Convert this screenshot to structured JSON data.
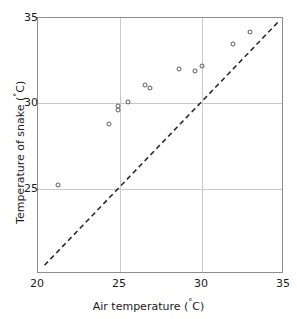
{
  "chart_data": {
    "type": "scatter",
    "title": "",
    "xlabel": "Air temperature (°C)",
    "ylabel": "Temperature of snake (°C)",
    "xlim": [
      20,
      35
    ],
    "ylim": [
      20,
      35
    ],
    "xticks": [
      20,
      25,
      30,
      35
    ],
    "yticks": [
      25,
      30,
      35
    ],
    "xtick_labels": [
      "20",
      "25",
      "30",
      "35"
    ],
    "ytick_labels": [
      "25",
      "30",
      "35"
    ],
    "grid": true,
    "legend": null,
    "marker_style": "open-circle",
    "points": [
      {
        "x": 21.2,
        "y": 25.2
      },
      {
        "x": 24.3,
        "y": 28.8
      },
      {
        "x": 24.9,
        "y": 29.6
      },
      {
        "x": 24.9,
        "y": 29.85
      },
      {
        "x": 25.5,
        "y": 30.1
      },
      {
        "x": 26.5,
        "y": 31.1
      },
      {
        "x": 26.8,
        "y": 30.9
      },
      {
        "x": 28.6,
        "y": 32.0
      },
      {
        "x": 29.6,
        "y": 31.9
      },
      {
        "x": 30.0,
        "y": 32.2
      },
      {
        "x": 31.9,
        "y": 33.5
      },
      {
        "x": 32.9,
        "y": 34.2
      }
    ],
    "reference_line": {
      "style": "dashed",
      "description": "1:1 line",
      "x": [
        20.4,
        34.8
      ],
      "y": [
        20.4,
        34.8
      ]
    },
    "colors": {
      "marker_edge": "#5a5a66",
      "frame": "#8d8d8d",
      "grid": "#c9c9c9",
      "reference_line": "#2b2b33",
      "text": "#1a1a1a",
      "background": "#ffffff"
    }
  },
  "axis": {
    "degree_symbol": "°",
    "x_title_prefix": "Air temperature (",
    "x_title_suffix": "C)",
    "y_title_prefix": "Temperature of snake (",
    "y_title_suffix": "C)"
  }
}
